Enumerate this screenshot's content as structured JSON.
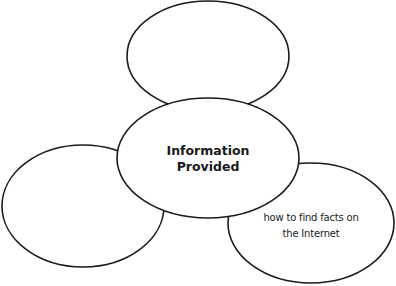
{
  "diagram": {
    "type": "web-organizer",
    "stroke_color": "#1a1a1a",
    "center": {
      "text_line1": "Information",
      "text_line2": "Provided"
    },
    "top": {
      "text": ""
    },
    "left": {
      "text": ""
    },
    "right": {
      "text_line1": "how to find facts on",
      "text_line2": "the Internet"
    }
  }
}
